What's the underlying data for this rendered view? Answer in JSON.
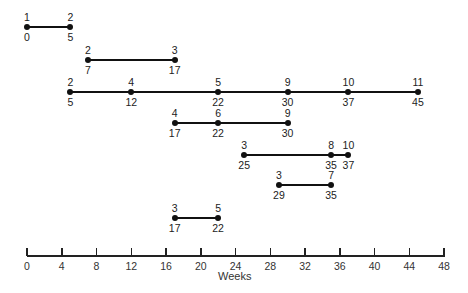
{
  "diagram": {
    "type": "event-timeline",
    "axis": {
      "label": "Weeks",
      "min": 0,
      "max": 48,
      "ticks": [
        0,
        4,
        8,
        12,
        16,
        20,
        24,
        28,
        32,
        36,
        40,
        44,
        48
      ]
    },
    "rows": [
      {
        "points": [
          {
            "event": "1",
            "week": 0
          },
          {
            "event": "2",
            "week": 5
          }
        ]
      },
      {
        "points": [
          {
            "event": "2",
            "week": 7
          },
          {
            "event": "3",
            "week": 17
          }
        ]
      },
      {
        "points": [
          {
            "event": "2",
            "week": 5
          },
          {
            "event": "4",
            "week": 12
          },
          {
            "event": "5",
            "week": 22
          },
          {
            "event": "9",
            "week": 30
          },
          {
            "event": "10",
            "week": 37
          },
          {
            "event": "11",
            "week": 45
          }
        ]
      },
      {
        "points": [
          {
            "event": "4",
            "week": 17
          },
          {
            "event": "6",
            "week": 22
          },
          {
            "event": "9",
            "week": 30
          }
        ]
      },
      {
        "points": [
          {
            "event": "3",
            "week": 25
          },
          {
            "event": "8",
            "week": 35
          },
          {
            "event": "10",
            "week": 37
          }
        ]
      },
      {
        "points": [
          {
            "event": "3",
            "week": 29
          },
          {
            "event": "7",
            "week": 35
          }
        ]
      },
      {
        "points": [
          {
            "event": "3",
            "week": 17
          },
          {
            "event": "5",
            "week": 22
          }
        ]
      }
    ]
  },
  "colors": {
    "line": "#111111",
    "text": "#222222",
    "background": "#ffffff"
  }
}
